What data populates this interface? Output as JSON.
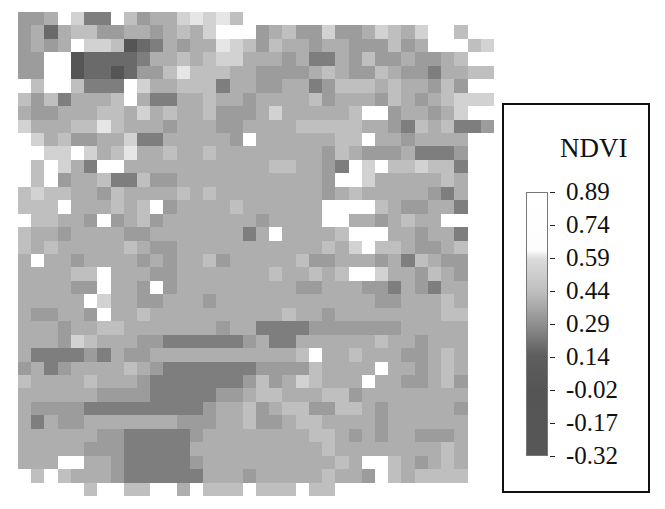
{
  "chart_data": {
    "type": "heatmap",
    "title": "NDVI",
    "colormap": "grayscale (white = high NDVI, dark = low NDVI)",
    "colorbar": {
      "label": "NDVI",
      "ticks": [
        "0.89",
        "0.74",
        "0.59",
        "0.44",
        "0.29",
        "0.14",
        "-0.02",
        "-0.17",
        "-0.32"
      ],
      "range": [
        -0.32,
        0.89
      ]
    },
    "grid_size": [
      36,
      36
    ],
    "level_scale": "0 = white (~0.89) ... 9 = darkest (~-0.32); approximate per-cell reading",
    "levels": [
      "554.2660354421213.0000000000000000",
      "5474335544543420005435525542342003.",
      "545402238764544123534454455535400032",
      "5500877776443432244454664535545543",
      "550087787553133344555543455345564433",
      "0300366602443336445544653334344535",
      "3536444304664434454444354445345432223",
      "4554443342434435554244444300544542",
      "244433134445444554444333334456343665",
      "0243554426644444504444443304454444",
      "0022024314434434444444453455546665",
      "0302460044444444444334456020332336",
      "0305443663554444444444450024444434",
      "3233445344443434444444454344444564",
      "3330444343054444344444400003455446",
      "03344505435444444454444004454344",
      "3445444455444444464044443000445446",
      "3434444434554444444444434203345543",
      "4044544445454435444443554445463455",
      "4444330444554444444344343002445345",
      "4444550445054444444445544455645644",
      "4444402445544454444444444445544434",
      "4554450443444444444434454444444433",
      "4445443344444445446666555555544444",
      "4445234445566666654664444443445444",
      "4666656455444444444443044344455434",
      "5465444434566666665555344440445434",
      "3444434445666666653542344404455435",
      "4444445555666665543344433544444444",
      "4555566666666654435433553345444445",
      "4645544444445554435543344445444444",
      "4444445566666544444444334545445554",
      "4444455566666444444444434444444434",
      "4440044566666544444444443400345434",
      "0303444566666644454444434450343333",
      "00000300330040333033303300000000.0"
    ]
  },
  "legend": {
    "title": "NDVI",
    "labels": [
      "0.89",
      "0.74",
      "0.59",
      "0.44",
      "0.29",
      "0.14",
      "-0.02",
      "-0.17",
      "-0.32"
    ]
  }
}
